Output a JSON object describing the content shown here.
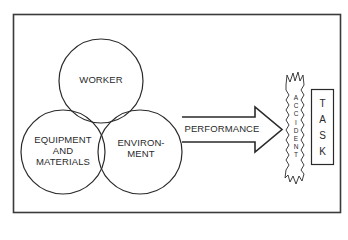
{
  "diagram": {
    "type": "venn-to-flow",
    "circles": [
      {
        "id": "worker",
        "label_lines": [
          "WORKER"
        ]
      },
      {
        "id": "equipment",
        "label_lines": [
          "EQUIPMENT",
          "AND",
          "MATERIALS"
        ]
      },
      {
        "id": "environment",
        "label_lines": [
          "ENVIRON-",
          "MENT"
        ]
      }
    ],
    "arrow": {
      "label": "PERFORMANCE"
    },
    "accident": {
      "label": "ACCIDENT",
      "letters": [
        "A",
        "C",
        "C",
        "I",
        "D",
        "E",
        "N",
        "T"
      ]
    },
    "task": {
      "label": "TASK",
      "letters": [
        "T",
        "A",
        "S",
        "K"
      ]
    },
    "colors": {
      "stroke": "#2a2a2a",
      "background": "#ffffff"
    }
  }
}
